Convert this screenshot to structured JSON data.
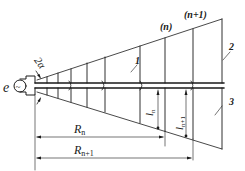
{
  "diagram": {
    "type": "log-periodic dipole antenna schematic",
    "labels": {
      "source": "e",
      "source_symbol": "~",
      "angle": "2α",
      "element_n": "(n)",
      "element_n1": "(n+1)",
      "callout_1": "1",
      "callout_2": "2",
      "callout_3": "3",
      "l_n": "l",
      "l_n_sub": "n",
      "l_n1": "l",
      "l_n1_sub": "n+1",
      "R_n": "R",
      "R_n_sub": "n",
      "R_n1": "R",
      "R_n1_sub": "n+1"
    },
    "colors": {
      "line": "#1a1a1a",
      "background": "#ffffff"
    }
  }
}
